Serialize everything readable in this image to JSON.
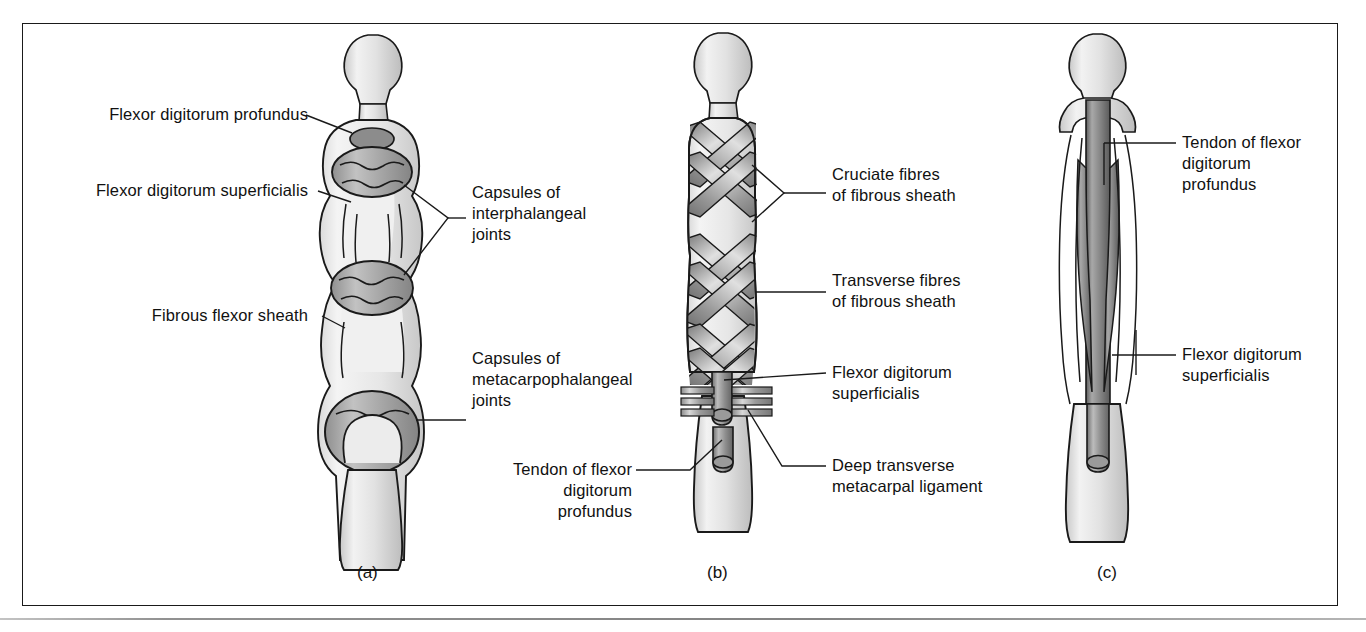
{
  "figure": {
    "background_color": "#ffffff",
    "line_color": "#1a1a1a",
    "fill_light": "#e8e8e8",
    "fill_mid": "#b3b3b3",
    "fill_dark": "#7d7d7d"
  },
  "panels": [
    {
      "id": "a",
      "caption": "(a)",
      "description": "Finger with fibrous flexor sheath removed showing joint capsules and flexor tendons"
    },
    {
      "id": "b",
      "caption": "(b)",
      "description": "Finger showing cruciate and transverse fibres of the fibrous flexor sheath"
    },
    {
      "id": "c",
      "caption": "(c)",
      "description": "Finger with sheath opened showing flexor tendon arrangement"
    }
  ],
  "labels": {
    "a": [
      {
        "id": "a1",
        "text": "Flexor digitorum profundus",
        "align": "right"
      },
      {
        "id": "a2",
        "text": "Flexor digitorum superficialis",
        "align": "right"
      },
      {
        "id": "a3",
        "text": "Fibrous flexor sheath",
        "align": "right"
      },
      {
        "id": "a4",
        "text": "Capsules of\ninterphalangeal\njoints",
        "align": "left"
      },
      {
        "id": "a5",
        "text": "Capsules of\nmetacarpophalangeal\njoints",
        "align": "left"
      }
    ],
    "b": [
      {
        "id": "b1",
        "text": "Cruciate fibres\nof fibrous sheath",
        "align": "left"
      },
      {
        "id": "b2",
        "text": "Transverse fibres\nof fibrous sheath",
        "align": "left"
      },
      {
        "id": "b3",
        "text": "Flexor digitorum\nsuperficialis",
        "align": "left"
      },
      {
        "id": "b4",
        "text": "Deep transverse\nmetacarpal ligament",
        "align": "left"
      },
      {
        "id": "b5",
        "text": "Tendon of flexor\ndigitorum\nprofundus",
        "align": "right"
      }
    ],
    "c": [
      {
        "id": "c1",
        "text": "Tendon of flexor\ndigitorum\nprofundus",
        "align": "left"
      },
      {
        "id": "c2",
        "text": "Flexor digitorum\nsuperficialis",
        "align": "left"
      }
    ]
  }
}
